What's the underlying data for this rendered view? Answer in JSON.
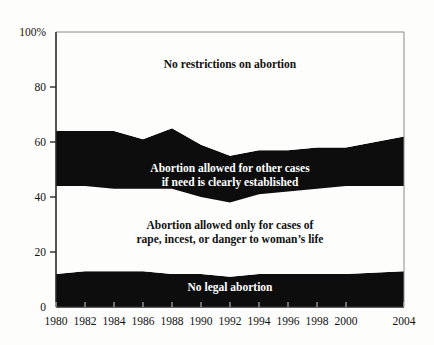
{
  "chart_data": {
    "type": "area",
    "title": "",
    "subtitle": "",
    "xlabel": "",
    "ylabel": "",
    "stacked": true,
    "percent": true,
    "grid": false,
    "legend_position": "inline-band-labels",
    "ylim": [
      0,
      100
    ],
    "y_ticks": [
      0,
      20,
      40,
      60,
      80,
      100
    ],
    "y_tick_labels": [
      "0",
      "20",
      "40",
      "60",
      "80",
      "100%"
    ],
    "x": [
      1980,
      1982,
      1984,
      1986,
      1988,
      1990,
      1992,
      1994,
      1996,
      1998,
      2000,
      2004
    ],
    "x_tick_labels": [
      "1980",
      "1982",
      "1984",
      "1986",
      "1988",
      "1990",
      "1992",
      "1994",
      "1996",
      "1998",
      "2000",
      "2004"
    ],
    "categories": [
      "1980",
      "1982",
      "1984",
      "1986",
      "1988",
      "1990",
      "1992",
      "1994",
      "1996",
      "1998",
      "2000",
      "2004"
    ],
    "series": [
      {
        "name": "No legal abortion",
        "label": "No legal abortion",
        "color": "#0d0d0d",
        "text_color": "#ffffff",
        "values": [
          12,
          13,
          13,
          13,
          12,
          12,
          11,
          12,
          12,
          12,
          12,
          13
        ]
      },
      {
        "name": "Abortion allowed only for cases of rape, incest, or danger to woman's life",
        "label_line1": "Abortion allowed only for cases of",
        "label_line2": "rape, incest, or danger to woman’s life",
        "color": "#fdfdfb",
        "text_color": "#111111",
        "values": [
          32,
          31,
          30,
          30,
          31,
          28,
          27,
          29,
          30,
          31,
          32,
          31
        ]
      },
      {
        "name": "Abortion allowed for other cases if need is clearly established",
        "label_line1": "Abortion allowed for other cases",
        "label_line2": "if need is clearly established",
        "color": "#0d0d0d",
        "text_color": "#ffffff",
        "values": [
          20,
          20,
          21,
          18,
          22,
          19,
          17,
          16,
          15,
          15,
          14,
          18
        ]
      },
      {
        "name": "No restrictions on abortion",
        "label": "No restrictions on abortion",
        "color": "#fdfdfb",
        "text_color": "#111111",
        "values": [
          36,
          36,
          36,
          39,
          35,
          41,
          45,
          43,
          43,
          42,
          42,
          38
        ]
      }
    ],
    "boundaries": {
      "note": "cumulative stacked tops as percent of total",
      "b1": [
        12,
        13,
        13,
        13,
        12,
        12,
        11,
        12,
        12,
        12,
        12,
        13
      ],
      "b2": [
        44,
        44,
        43,
        43,
        43,
        40,
        38,
        41,
        42,
        43,
        44,
        44
      ],
      "b3": [
        64,
        64,
        64,
        61,
        65,
        59,
        55,
        57,
        57,
        58,
        58,
        62
      ]
    }
  },
  "labels": {
    "band_top": "No restrictions on abortion",
    "band_upper_mid_line1": "Abortion allowed for other cases",
    "band_upper_mid_line2": "if need is clearly established",
    "band_lower_mid_line1": "Abortion allowed only for cases of",
    "band_lower_mid_line2": "rape, incest, or danger to woman’s life",
    "band_bottom": "No legal abortion"
  },
  "axis": {
    "y_labels": [
      "100%",
      "80",
      "60",
      "40",
      "20",
      "0"
    ],
    "x_labels": [
      "1980",
      "1982",
      "1984",
      "1986",
      "1988",
      "1990",
      "1992",
      "1994",
      "1996",
      "1998",
      "2000",
      "2004"
    ]
  },
  "colors": {
    "ink": "#0d0d0d",
    "paper": "#fdfdfb",
    "axis": "#3a3a3a"
  }
}
